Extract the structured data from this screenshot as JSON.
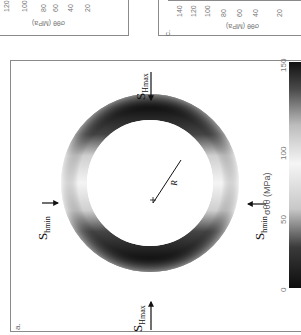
{
  "figure": {
    "panels": [
      {
        "id": "a",
        "label": "a.",
        "stress_labels": {
          "shmax_top": {
            "main": "S",
            "sub": "Hmax"
          },
          "shmax_bottom": {
            "main": "S",
            "sub": "Hmax"
          },
          "shmin_left": {
            "main": "S",
            "sub": "hmin"
          },
          "shmin_right": {
            "main": "S",
            "sub": "hmin"
          }
        },
        "radius_label": "R",
        "colorbar": {
          "label": "σθθ (MPa)",
          "ticks": [
            "0",
            "50",
            "100",
            "150"
          ],
          "min": 0,
          "max": 150
        }
      },
      {
        "id": "b",
        "label": "",
        "axis_label": "σθθ (MPa)",
        "ticks": [
          "120",
          "100",
          "80",
          "60",
          "40",
          "20"
        ]
      },
      {
        "id": "c",
        "label": "c.",
        "axis_label": "σθθ (MPa)",
        "ticks": [
          "140",
          "120",
          "100",
          "80",
          "60",
          "40",
          "20"
        ]
      }
    ]
  },
  "colors": {
    "frame": "#8a8a8a",
    "ring_dark": "#1a1a1a",
    "ring_light": "#f2f2f2",
    "text": "#111111",
    "tick_text": "#777777"
  }
}
